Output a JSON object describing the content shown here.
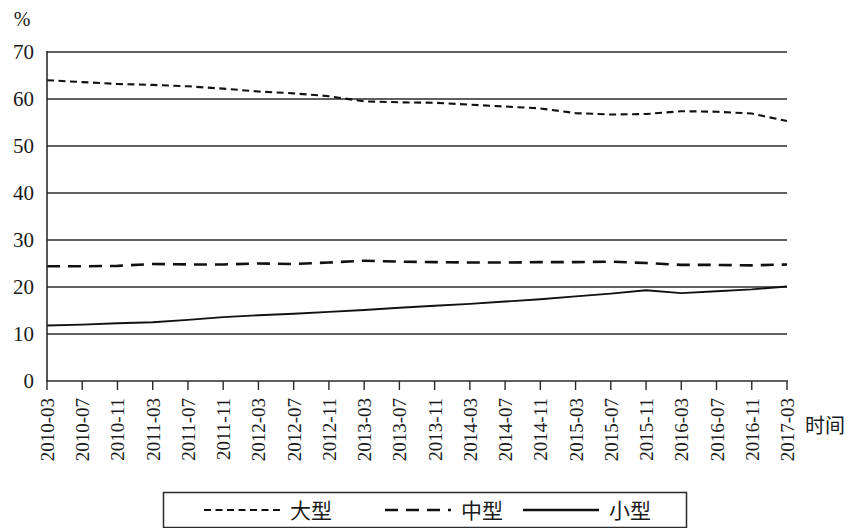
{
  "chart_data": {
    "type": "line",
    "title": "",
    "subtitle": "",
    "unit_label": "%",
    "xlabel": "时间",
    "ylabel": "",
    "ylim": [
      0,
      70
    ],
    "yticks": [
      0,
      10,
      20,
      30,
      40,
      50,
      60,
      70
    ],
    "grid": "horizontal",
    "legend_position": "bottom",
    "categories": [
      "2010-03",
      "2010-07",
      "2010-11",
      "2011-03",
      "2011-07",
      "2011-11",
      "2012-03",
      "2012-07",
      "2012-11",
      "2013-03",
      "2013-07",
      "2013-11",
      "2014-03",
      "2014-07",
      "2014-11",
      "2015-03",
      "2015-07",
      "2015-11",
      "2016-03",
      "2016-07",
      "2016-11",
      "2017-03"
    ],
    "series": [
      {
        "name": "大型",
        "style": "dotted-dash",
        "values": [
          64.0,
          63.6,
          63.2,
          63.0,
          62.7,
          62.2,
          61.6,
          61.2,
          60.6,
          59.5,
          59.3,
          59.2,
          58.8,
          58.4,
          58.0,
          57.0,
          56.7,
          56.8,
          57.4,
          57.3,
          56.9,
          55.3
        ]
      },
      {
        "name": "中型",
        "style": "dashed",
        "values": [
          24.4,
          24.4,
          24.5,
          24.9,
          24.8,
          24.8,
          25.0,
          24.9,
          25.2,
          25.6,
          25.4,
          25.3,
          25.2,
          25.2,
          25.3,
          25.3,
          25.4,
          25.1,
          24.7,
          24.7,
          24.6,
          24.8
        ]
      },
      {
        "name": "小型",
        "style": "solid",
        "values": [
          11.8,
          12.0,
          12.3,
          12.5,
          13.0,
          13.6,
          14.0,
          14.3,
          14.7,
          15.1,
          15.6,
          16.0,
          16.4,
          16.9,
          17.4,
          18.0,
          18.6,
          19.3,
          18.7,
          19.1,
          19.5,
          20.1
        ]
      }
    ]
  },
  "legend": {
    "entries": [
      {
        "label": "大型",
        "style": "dotted-dash"
      },
      {
        "label": "中型",
        "style": "dashed"
      },
      {
        "label": "小型",
        "style": "solid"
      }
    ]
  },
  "axis": {
    "unit": "%",
    "x_title": "时间"
  }
}
